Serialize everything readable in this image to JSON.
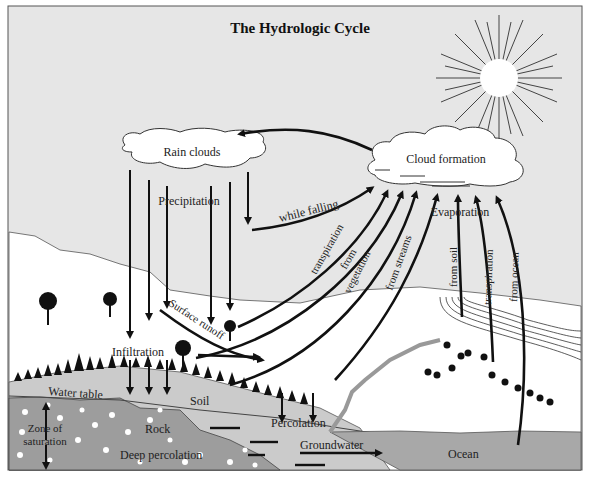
{
  "title": "The Hydrologic Cycle",
  "labels": {
    "rain_clouds": "Rain clouds",
    "cloud_formation": "Cloud formation",
    "precipitation": "Precipitation",
    "while_falling": "while falling",
    "transpiration": "transpiration",
    "from": "from",
    "vegetation": "vegetation",
    "from_streams": "from streams",
    "evaporation": "Evaporation",
    "from_soil": "from soil",
    "transpiration_right": "transpiration",
    "from_ocean": "from ocean",
    "surface_runoff": "Surface runoff",
    "infiltration": "Infiltration",
    "water_table": "Water table",
    "soil": "Soil",
    "zone_of": "Zone of",
    "saturation": "saturation",
    "rock": "Rock",
    "percolation": "Percolation",
    "groundwater": "Groundwater",
    "deep_percolation": "Deep percolation",
    "ocean": "Ocean"
  },
  "colors": {
    "sky": "#e6e6e6",
    "land": "#ffffff",
    "soil": "#c9c9c9",
    "rock": "#9c9c9c",
    "ocean": "#a9a9a9",
    "ink": "#111111"
  }
}
